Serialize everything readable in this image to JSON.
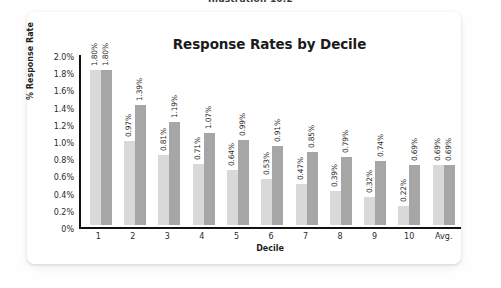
{
  "caption": "Illustration 10.2",
  "card": {
    "title": "Response Rates by Decile"
  },
  "legend": {
    "items": [
      {
        "label": "% Response",
        "color": "#d9d9d9",
        "key": "response"
      },
      {
        "label": "Cumulative % Response",
        "color": "#a6a6a6",
        "key": "cumulative"
      }
    ]
  },
  "chart_data": {
    "type": "bar",
    "title": "Response Rates by Decile",
    "xlabel": "Decile",
    "ylabel": "% Response Rate",
    "ylim": [
      0,
      2.0
    ],
    "yticks": [
      "0%",
      "0.2%",
      "0.4%",
      "0.6%",
      "0.8%",
      "1.0%",
      "1.2%",
      "1.4%",
      "1.6%",
      "1.8%",
      "2.0%"
    ],
    "ytick_values": [
      0,
      0.2,
      0.4,
      0.6,
      0.8,
      1.0,
      1.2,
      1.4,
      1.6,
      1.8,
      2.0
    ],
    "grid": false,
    "legend_position": "top-center",
    "categories": [
      "1",
      "2",
      "3",
      "4",
      "5",
      "6",
      "7",
      "8",
      "9",
      "10",
      "Avg."
    ],
    "series": [
      {
        "name": "% Response",
        "color": "#d9d9d9",
        "values": [
          1.8,
          0.97,
          0.81,
          0.71,
          0.64,
          0.53,
          0.47,
          0.39,
          0.32,
          0.22,
          0.69
        ],
        "labels": [
          "1.80%",
          "0.97%",
          "0.81%",
          "0.71%",
          "0.64%",
          "0.53%",
          "0.47%",
          "0.39%",
          "0.32%",
          "0.22%",
          "0.69%"
        ]
      },
      {
        "name": "Cumulative % Response",
        "color": "#a6a6a6",
        "values": [
          1.8,
          1.39,
          1.19,
          1.07,
          0.99,
          0.91,
          0.85,
          0.79,
          0.74,
          0.69,
          0.69
        ],
        "labels": [
          "1.80%",
          "1.39%",
          "1.19%",
          "1.07%",
          "0.99%",
          "0.91%",
          "0.85%",
          "0.79%",
          "0.74%",
          "0.69%",
          "0.69%"
        ]
      }
    ]
  }
}
